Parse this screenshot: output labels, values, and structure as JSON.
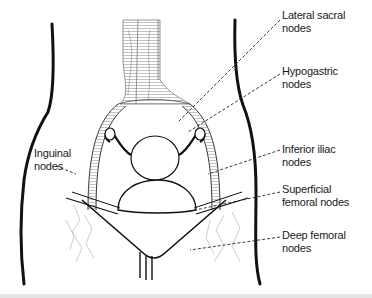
{
  "diagram": {
    "labels": [
      {
        "id": "lateral-sacral",
        "line1": "Lateral sacral",
        "line2": "nodes",
        "x": 282,
        "y": 9
      },
      {
        "id": "hypogastric",
        "line1": "Hypogastric",
        "line2": "nodes",
        "x": 282,
        "y": 65
      },
      {
        "id": "inferior-iliac",
        "line1": "Inferior iliac",
        "line2": "nodes",
        "x": 282,
        "y": 143
      },
      {
        "id": "superficial-femoral",
        "line1": "Superficial",
        "line2": "femoral nodes",
        "x": 282,
        "y": 183
      },
      {
        "id": "deep-femoral",
        "line1": "Deep femoral",
        "line2": "nodes",
        "x": 282,
        "y": 229
      },
      {
        "id": "inguinal",
        "line1": "Inguinal",
        "line2": "nodes",
        "x": 34,
        "y": 147
      }
    ]
  }
}
